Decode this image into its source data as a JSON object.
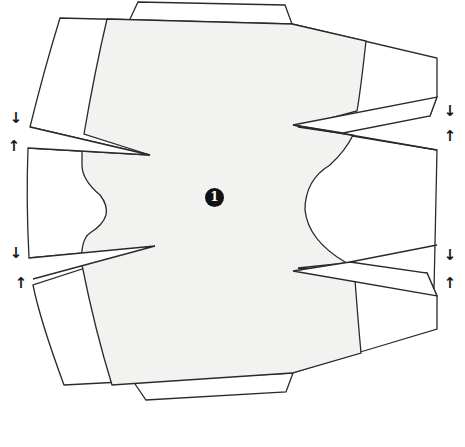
{
  "diagram": {
    "type": "sewing-pattern-piece",
    "piece_label": "1",
    "colors": {
      "main_panel_fill": "#f2f2f0",
      "outline": "#2a2a2a",
      "background": "#ffffff"
    },
    "arrows": [
      {
        "id": "left-upper-down",
        "glyph": "↓"
      },
      {
        "id": "left-upper-up",
        "glyph": "↑"
      },
      {
        "id": "left-lower-down",
        "glyph": "↓"
      },
      {
        "id": "left-lower-up",
        "glyph": "↑"
      },
      {
        "id": "right-upper-down",
        "glyph": "↓"
      },
      {
        "id": "right-upper-up",
        "glyph": "↑"
      },
      {
        "id": "right-lower-down",
        "glyph": "↓"
      },
      {
        "id": "right-lower-up",
        "glyph": "↑"
      }
    ]
  }
}
